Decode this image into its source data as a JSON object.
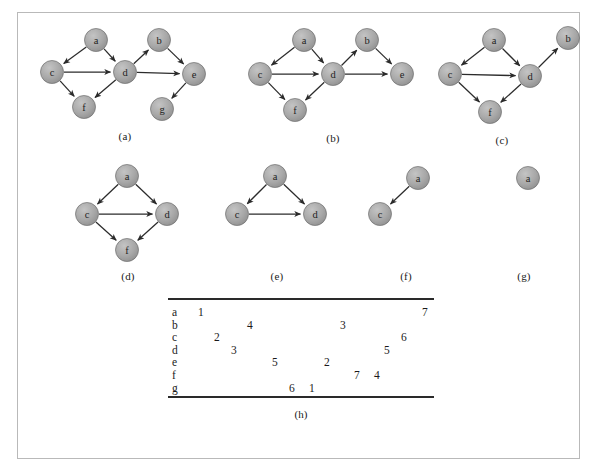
{
  "figure": {
    "node_fill": "#a8a8a8",
    "node_stroke": "#6e6e6e",
    "edge_color": "#2b2b2b",
    "frame_color": "#b9b9b9"
  },
  "panels": [
    {
      "id": "a",
      "caption": "(a)",
      "nodes": [
        {
          "id": "a",
          "label": "a",
          "x": 66,
          "y": 18
        },
        {
          "id": "b",
          "label": "b",
          "x": 129,
          "y": 18
        },
        {
          "id": "c",
          "label": "c",
          "x": 22,
          "y": 50
        },
        {
          "id": "d",
          "label": "d",
          "x": 95,
          "y": 50
        },
        {
          "id": "e",
          "label": "e",
          "x": 164,
          "y": 52
        },
        {
          "id": "f",
          "label": "f",
          "x": 54,
          "y": 85
        },
        {
          "id": "g",
          "label": "g",
          "x": 132,
          "y": 87
        }
      ],
      "edges": [
        {
          "from": "a",
          "to": "c"
        },
        {
          "from": "a",
          "to": "d"
        },
        {
          "from": "c",
          "to": "d"
        },
        {
          "from": "c",
          "to": "f"
        },
        {
          "from": "d",
          "to": "f"
        },
        {
          "from": "d",
          "to": "b"
        },
        {
          "from": "d",
          "to": "e"
        },
        {
          "from": "b",
          "to": "e"
        },
        {
          "from": "e",
          "to": "g"
        }
      ]
    },
    {
      "id": "b",
      "caption": "(b)",
      "nodes": [
        {
          "id": "a",
          "label": "a",
          "x": 66,
          "y": 18
        },
        {
          "id": "b",
          "label": "b",
          "x": 129,
          "y": 18
        },
        {
          "id": "c",
          "label": "c",
          "x": 22,
          "y": 52
        },
        {
          "id": "d",
          "label": "d",
          "x": 95,
          "y": 52
        },
        {
          "id": "e",
          "label": "e",
          "x": 164,
          "y": 52
        },
        {
          "id": "f",
          "label": "f",
          "x": 57,
          "y": 88
        }
      ],
      "edges": [
        {
          "from": "a",
          "to": "c"
        },
        {
          "from": "a",
          "to": "d"
        },
        {
          "from": "c",
          "to": "d"
        },
        {
          "from": "c",
          "to": "f"
        },
        {
          "from": "d",
          "to": "f"
        },
        {
          "from": "d",
          "to": "b"
        },
        {
          "from": "d",
          "to": "e"
        },
        {
          "from": "b",
          "to": "e"
        }
      ]
    },
    {
      "id": "c",
      "caption": "(c)",
      "nodes": [
        {
          "id": "a",
          "label": "a",
          "x": 62,
          "y": 18
        },
        {
          "id": "b",
          "label": "b",
          "x": 136,
          "y": 16
        },
        {
          "id": "c",
          "label": "c",
          "x": 18,
          "y": 52
        },
        {
          "id": "d",
          "label": "d",
          "x": 98,
          "y": 54
        },
        {
          "id": "f",
          "label": "f",
          "x": 58,
          "y": 90
        }
      ],
      "edges": [
        {
          "from": "a",
          "to": "c"
        },
        {
          "from": "a",
          "to": "d"
        },
        {
          "from": "c",
          "to": "d"
        },
        {
          "from": "c",
          "to": "f"
        },
        {
          "from": "d",
          "to": "f"
        },
        {
          "from": "d",
          "to": "b"
        }
      ]
    },
    {
      "id": "d",
      "caption": "(d)",
      "nodes": [
        {
          "id": "a",
          "label": "a",
          "x": 55,
          "y": 16
        },
        {
          "id": "c",
          "label": "c",
          "x": 15,
          "y": 54
        },
        {
          "id": "d",
          "label": "d",
          "x": 95,
          "y": 54
        },
        {
          "id": "f",
          "label": "f",
          "x": 55,
          "y": 90
        }
      ],
      "edges": [
        {
          "from": "a",
          "to": "c"
        },
        {
          "from": "a",
          "to": "d"
        },
        {
          "from": "c",
          "to": "d"
        },
        {
          "from": "c",
          "to": "f"
        },
        {
          "from": "d",
          "to": "f"
        }
      ]
    },
    {
      "id": "e",
      "caption": "(e)",
      "nodes": [
        {
          "id": "a",
          "label": "a",
          "x": 60,
          "y": 16
        },
        {
          "id": "c",
          "label": "c",
          "x": 22,
          "y": 54
        },
        {
          "id": "d",
          "label": "d",
          "x": 100,
          "y": 54
        }
      ],
      "edges": [
        {
          "from": "a",
          "to": "c"
        },
        {
          "from": "a",
          "to": "d"
        },
        {
          "from": "c",
          "to": "d"
        }
      ]
    },
    {
      "id": "f",
      "caption": "(f)",
      "nodes": [
        {
          "id": "a",
          "label": "a",
          "x": 56,
          "y": 18
        },
        {
          "id": "c",
          "label": "c",
          "x": 18,
          "y": 54
        }
      ],
      "edges": [
        {
          "from": "a",
          "to": "c"
        }
      ]
    },
    {
      "id": "g",
      "caption": "(g)",
      "nodes": [
        {
          "id": "a",
          "label": "a",
          "x": 50,
          "y": 18
        }
      ],
      "edges": []
    }
  ],
  "table": {
    "caption": "(h)",
    "rows": [
      {
        "label": "a",
        "entries": [
          {
            "value": "1",
            "x": 30
          },
          {
            "value": "7",
            "x": 254
          }
        ]
      },
      {
        "label": "b",
        "entries": [
          {
            "value": "4",
            "x": 79
          },
          {
            "value": "3",
            "x": 172
          }
        ]
      },
      {
        "label": "c",
        "entries": [
          {
            "value": "2",
            "x": 46
          },
          {
            "value": "6",
            "x": 233
          }
        ]
      },
      {
        "label": "d",
        "entries": [
          {
            "value": "3",
            "x": 63
          },
          {
            "value": "5",
            "x": 216
          }
        ]
      },
      {
        "label": "e",
        "entries": [
          {
            "value": "5",
            "x": 104
          },
          {
            "value": "2",
            "x": 156
          }
        ]
      },
      {
        "label": "f",
        "entries": [
          {
            "value": "7",
            "x": 186
          },
          {
            "value": "4",
            "x": 206
          }
        ]
      },
      {
        "label": "g",
        "entries": [
          {
            "value": "6",
            "x": 121
          },
          {
            "value": "1",
            "x": 141
          }
        ]
      }
    ]
  }
}
